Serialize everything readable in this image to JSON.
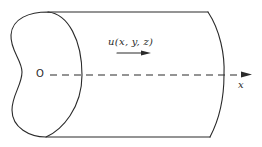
{
  "diagram": {
    "labels": {
      "origin": "O",
      "velocity": "u(x, y, z)",
      "x_axis": "x"
    },
    "elements": [
      "cross-section-outline",
      "pipe-top-edge",
      "pipe-bottom-edge",
      "pipe-end-arc",
      "x-axis-dashed-line",
      "x-axis-arrowhead",
      "velocity-arrow"
    ],
    "colors": {
      "line": "#2a2a2a",
      "background": "#ffffff"
    }
  }
}
